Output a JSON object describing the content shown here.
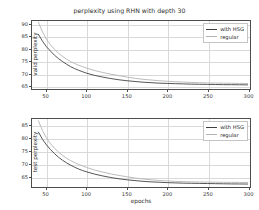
{
  "chart_data": [
    {
      "type": "line",
      "id": "valid",
      "title": "perplexity using RHN with depth 30",
      "xlabel": "",
      "ylabel": "valid perplexity",
      "xlim": [
        32,
        303
      ],
      "ylim": [
        63.5,
        91.5
      ],
      "xticks": [
        50,
        100,
        150,
        200,
        250,
        300
      ],
      "yticks": [
        65,
        70,
        75,
        80,
        85,
        90
      ],
      "grid": true,
      "legend_position": "upper right",
      "x": [
        40,
        45,
        50,
        55,
        60,
        65,
        70,
        75,
        80,
        85,
        90,
        95,
        100,
        110,
        120,
        130,
        140,
        150,
        160,
        170,
        180,
        190,
        200,
        210,
        220,
        230,
        240,
        250,
        260,
        270,
        280,
        290,
        300
      ],
      "series": [
        {
          "name": "with HSG",
          "color": "#3f3f3f",
          "values": [
            86.0,
            83.2,
            80.9,
            79.1,
            77.4,
            76.0,
            74.8,
            73.7,
            72.7,
            71.9,
            71.2,
            70.6,
            70.0,
            69.1,
            68.4,
            67.8,
            67.3,
            66.9,
            66.6,
            66.3,
            66.1,
            65.9,
            65.8,
            65.7,
            65.6,
            65.5,
            65.45,
            65.4,
            65.35,
            65.3,
            65.28,
            65.25,
            65.2
          ]
        },
        {
          "name": "regular",
          "color": "#b3b3b3",
          "values": [
            91.0,
            87.0,
            84.0,
            81.7,
            79.8,
            78.2,
            76.9,
            75.8,
            74.8,
            74.0,
            73.3,
            72.7,
            72.1,
            71.1,
            70.3,
            69.6,
            69.0,
            68.4,
            67.9,
            67.5,
            67.2,
            66.9,
            66.7,
            66.5,
            66.35,
            66.2,
            66.1,
            66.0,
            65.95,
            65.9,
            65.85,
            65.8,
            65.75
          ]
        }
      ]
    },
    {
      "type": "line",
      "id": "test",
      "title": "",
      "xlabel": "epochs",
      "ylabel": "test perplexity",
      "xlim": [
        32,
        303
      ],
      "ylim": [
        61.0,
        87.5
      ],
      "xticks": [
        50,
        100,
        150,
        200,
        250,
        300
      ],
      "yticks": [
        65,
        70,
        75,
        80,
        85
      ],
      "grid": true,
      "legend_position": "upper right",
      "x": [
        40,
        45,
        50,
        55,
        60,
        65,
        70,
        75,
        80,
        85,
        90,
        95,
        100,
        110,
        120,
        130,
        140,
        150,
        160,
        170,
        180,
        190,
        200,
        210,
        220,
        230,
        240,
        250,
        260,
        270,
        280,
        290,
        300
      ],
      "series": [
        {
          "name": "with HSG",
          "color": "#3f3f3f",
          "values": [
            82.4,
            79.6,
            77.4,
            75.6,
            74.0,
            72.6,
            71.4,
            70.4,
            69.5,
            68.7,
            68.0,
            67.4,
            66.9,
            66.0,
            65.3,
            64.7,
            64.2,
            63.8,
            63.5,
            63.2,
            63.0,
            62.85,
            62.7,
            62.6,
            62.5,
            62.45,
            62.4,
            62.35,
            62.3,
            62.25,
            62.2,
            62.18,
            62.15
          ]
        },
        {
          "name": "regular",
          "color": "#b3b3b3",
          "values": [
            86.8,
            83.0,
            80.1,
            77.9,
            76.1,
            74.6,
            73.3,
            72.2,
            71.3,
            70.5,
            69.8,
            69.2,
            68.6,
            67.6,
            66.8,
            66.1,
            65.5,
            65.0,
            64.5,
            64.1,
            63.8,
            63.55,
            63.35,
            63.2,
            63.1,
            63.0,
            62.95,
            62.9,
            62.85,
            62.82,
            62.8,
            62.78,
            62.75
          ]
        }
      ]
    }
  ],
  "legend": {
    "entries": [
      {
        "label": "with HSG",
        "color": "#3f3f3f"
      },
      {
        "label": "regular",
        "color": "#b3b3b3"
      }
    ]
  }
}
